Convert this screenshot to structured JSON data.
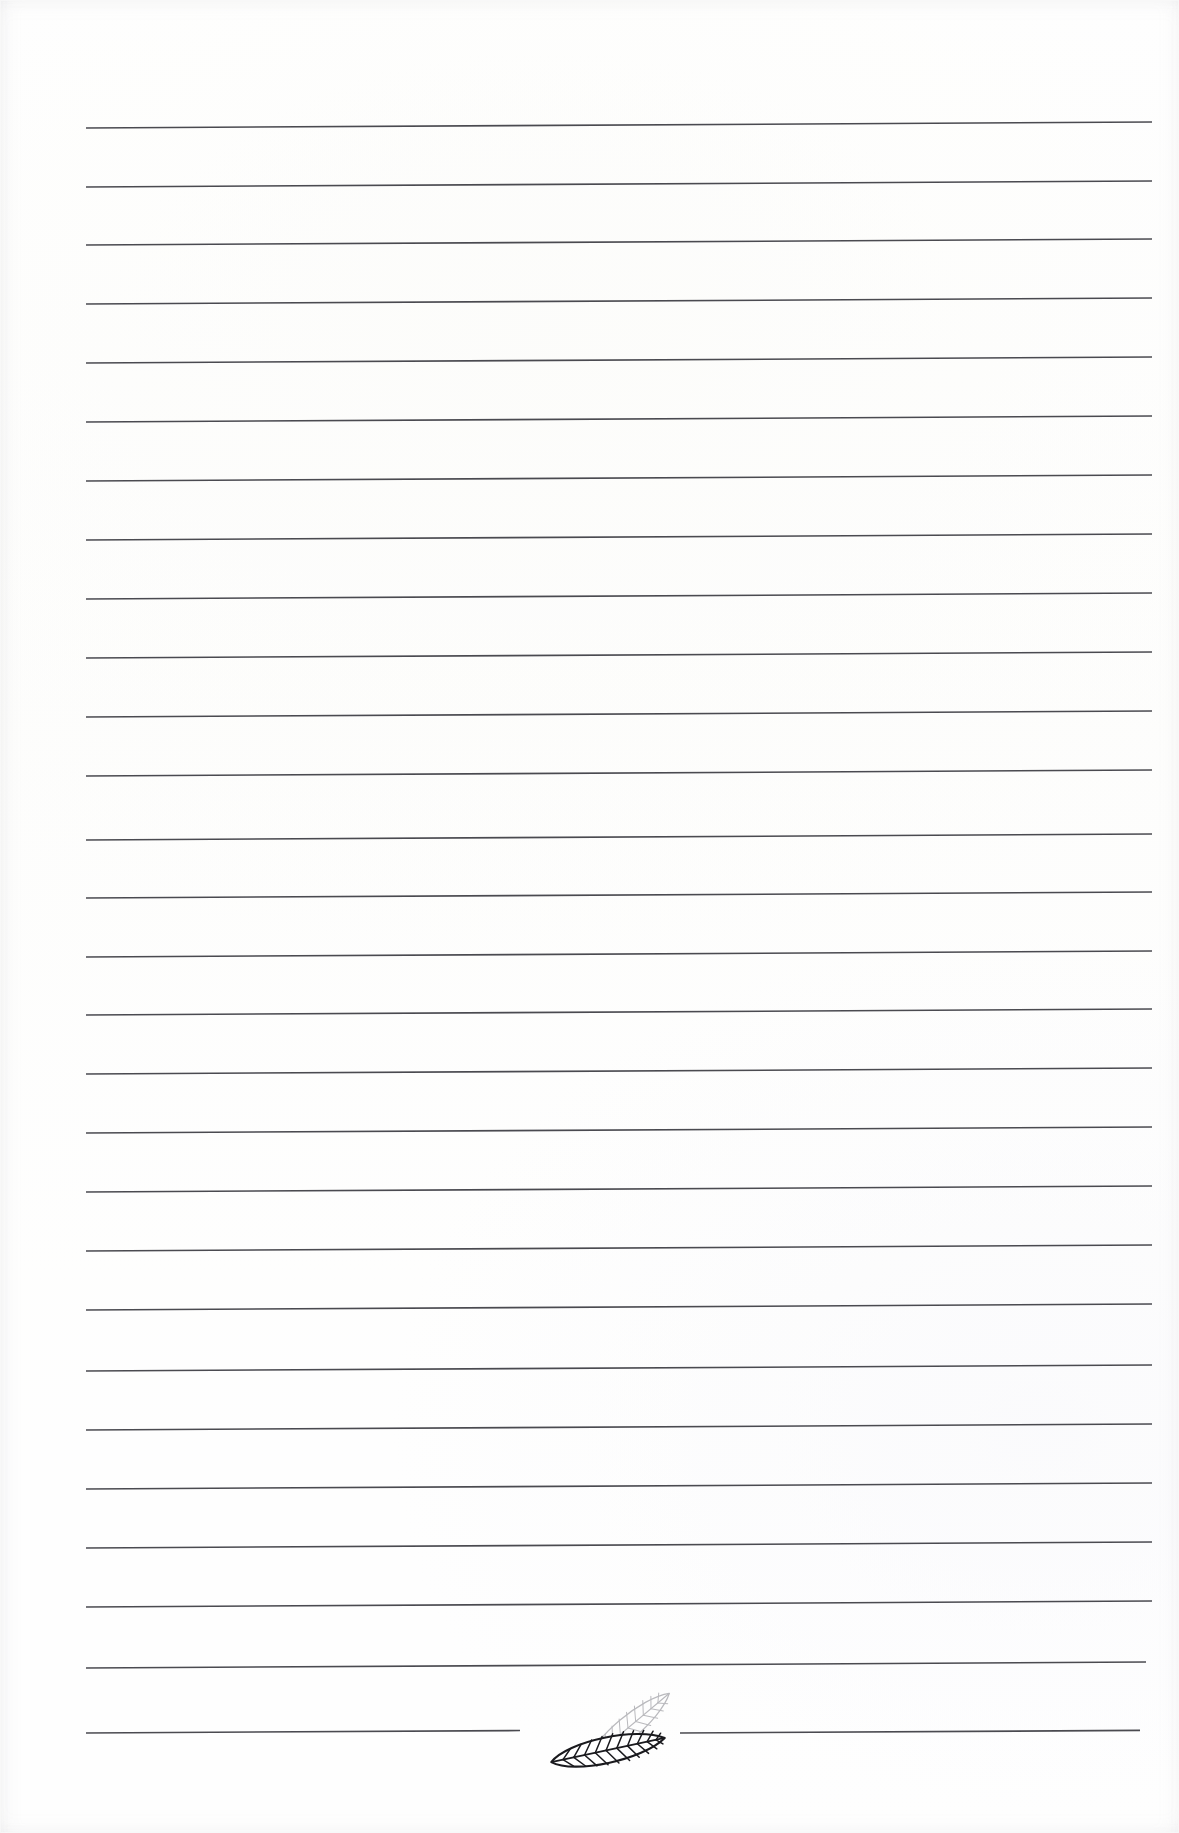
{
  "document": {
    "kind": "scanned-lined-notepad-page",
    "title": "Lined Notepad Page",
    "page_width": 1179,
    "page_height": 1833,
    "background_color": "#fefefe",
    "has_text_content": false,
    "text_content": "",
    "orientation": "portrait"
  },
  "ruling": {
    "name": "horizontal-ruled-lines",
    "line_color": "#4a4a50",
    "line_thickness_px": 1.6,
    "line_count": 28,
    "first_line_y": 128,
    "line_spacing_px": 58.8,
    "left_margin_x": 86,
    "right_margin_x": 1152,
    "skew_note": "lines slope downward-to-upward slightly from scan skew",
    "skew_drop_px": -6,
    "lines": [
      {
        "index": 1,
        "y": 128,
        "x_start": 86,
        "x_end": 1152,
        "interrupted": false
      },
      {
        "index": 2,
        "y": 187,
        "x_start": 86,
        "x_end": 1152,
        "interrupted": false
      },
      {
        "index": 3,
        "y": 245,
        "x_start": 86,
        "x_end": 1152,
        "interrupted": false
      },
      {
        "index": 4,
        "y": 304,
        "x_start": 86,
        "x_end": 1152,
        "interrupted": false
      },
      {
        "index": 5,
        "y": 363,
        "x_start": 86,
        "x_end": 1152,
        "interrupted": false
      },
      {
        "index": 6,
        "y": 422,
        "x_start": 86,
        "x_end": 1152,
        "interrupted": false
      },
      {
        "index": 7,
        "y": 481,
        "x_start": 86,
        "x_end": 1152,
        "interrupted": false
      },
      {
        "index": 8,
        "y": 540,
        "x_start": 86,
        "x_end": 1152,
        "interrupted": false
      },
      {
        "index": 9,
        "y": 599,
        "x_start": 86,
        "x_end": 1152,
        "interrupted": false
      },
      {
        "index": 10,
        "y": 658,
        "x_start": 86,
        "x_end": 1152,
        "interrupted": false
      },
      {
        "index": 11,
        "y": 717,
        "x_start": 86,
        "x_end": 1152,
        "interrupted": false
      },
      {
        "index": 12,
        "y": 776,
        "x_start": 86,
        "x_end": 1152,
        "interrupted": false
      },
      {
        "index": 13,
        "y": 840,
        "x_start": 86,
        "x_end": 1152,
        "interrupted": false
      },
      {
        "index": 14,
        "y": 898,
        "x_start": 86,
        "x_end": 1152,
        "interrupted": false
      },
      {
        "index": 15,
        "y": 957,
        "x_start": 86,
        "x_end": 1152,
        "interrupted": false
      },
      {
        "index": 16,
        "y": 1015,
        "x_start": 86,
        "x_end": 1152,
        "interrupted": false
      },
      {
        "index": 17,
        "y": 1074,
        "x_start": 86,
        "x_end": 1152,
        "interrupted": false
      },
      {
        "index": 18,
        "y": 1133,
        "x_start": 86,
        "x_end": 1152,
        "interrupted": false
      },
      {
        "index": 19,
        "y": 1192,
        "x_start": 86,
        "x_end": 1152,
        "interrupted": false
      },
      {
        "index": 20,
        "y": 1251,
        "x_start": 86,
        "x_end": 1152,
        "interrupted": false
      },
      {
        "index": 21,
        "y": 1310,
        "x_start": 86,
        "x_end": 1152,
        "interrupted": false
      },
      {
        "index": 22,
        "y": 1371,
        "x_start": 86,
        "x_end": 1152,
        "interrupted": false
      },
      {
        "index": 23,
        "y": 1430,
        "x_start": 86,
        "x_end": 1152,
        "interrupted": false
      },
      {
        "index": 24,
        "y": 1489,
        "x_start": 86,
        "x_end": 1152,
        "interrupted": false
      },
      {
        "index": 25,
        "y": 1548,
        "x_start": 86,
        "x_end": 1152,
        "interrupted": false
      },
      {
        "index": 26,
        "y": 1607,
        "x_start": 86,
        "x_end": 1152,
        "interrupted": false
      },
      {
        "index": 27,
        "y": 1668,
        "x_start": 86,
        "x_end": 1146,
        "interrupted": false
      },
      {
        "index": 28,
        "y": 1733,
        "x_start": 86,
        "x_end": 520,
        "interrupted": true
      },
      {
        "index": 29,
        "y": 1733,
        "x_start": 680,
        "x_end": 1140,
        "interrupted": true
      }
    ]
  },
  "decoration": {
    "name": "leaf-motif",
    "description": "two overlapping lanceolate leaves drawn in outline with chevron lateral veins, straddling the bottom ruled line",
    "position_x": 540,
    "position_y": 1676,
    "width": 150,
    "height": 115,
    "leaves": [
      {
        "name": "back-leaf",
        "tone": "light",
        "stroke_color": "#b9b9bd",
        "stroke_width": 1.2,
        "rotation_deg": -40,
        "vein_pairs": 9
      },
      {
        "name": "front-leaf",
        "tone": "dark",
        "stroke_color": "#1a1a1e",
        "stroke_width": 2.1,
        "rotation_deg": -12,
        "vein_pairs": 10
      }
    ]
  }
}
